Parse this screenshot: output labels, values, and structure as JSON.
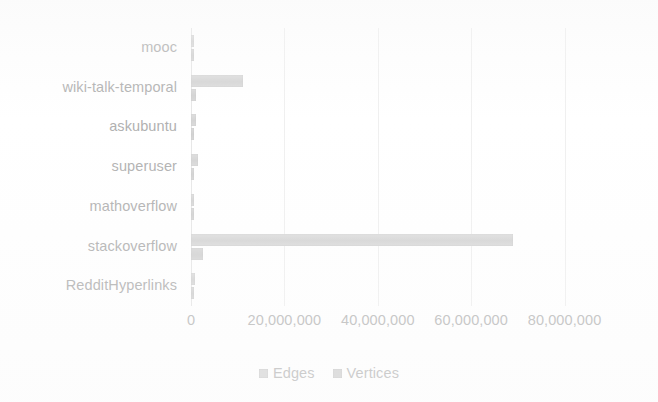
{
  "chart_data": {
    "type": "bar",
    "orientation": "horizontal",
    "title": "",
    "xlabel": "",
    "ylabel": "",
    "categories": [
      "mooc",
      "wiki-talk-temporal",
      "askubuntu",
      "superuser",
      "mathoverflow",
      "stackoverflow",
      "RedditHyperlinks"
    ],
    "series": [
      {
        "name": "Edges",
        "color": "#c6c6c6",
        "values": [
          411749,
          11030599,
          964000,
          1443339,
          506550,
          68900000,
          858490
        ]
      },
      {
        "name": "Vertices",
        "color": "#c0c0c0",
        "values": [
          7144,
          1140149,
          159316,
          194085,
          24818,
          2601977,
          55863
        ]
      }
    ],
    "xticks": [
      0,
      20000000,
      40000000,
      60000000,
      80000000
    ],
    "xtick_labels": [
      "0",
      "20,000,000",
      "40,000,000",
      "60,000,000",
      "80,000,000"
    ],
    "xlim": [
      0,
      88235294
    ],
    "grid": true,
    "legend": {
      "position": "bottom",
      "entries": [
        "Edges",
        "Vertices"
      ]
    }
  },
  "legend": {
    "edges_label": "Edges",
    "vertices_label": "Vertices"
  }
}
